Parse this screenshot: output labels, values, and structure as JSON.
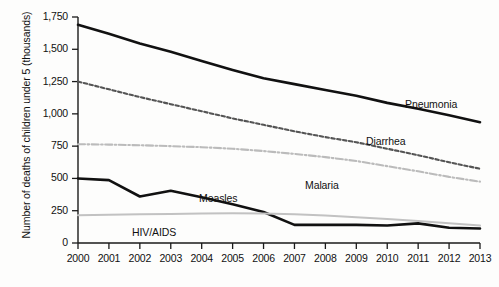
{
  "chart_data": {
    "type": "line",
    "title": "",
    "xlabel": "",
    "ylabel": "Number of deaths of children under 5 (thousands)",
    "x": [
      2000,
      2001,
      2002,
      2003,
      2004,
      2005,
      2006,
      2007,
      2008,
      2009,
      2010,
      2011,
      2012,
      2013
    ],
    "xticklabels": [
      "2000",
      "2001",
      "2002",
      "2003",
      "2004",
      "2005",
      "2006",
      "2007",
      "2008",
      "2009",
      "2010",
      "2011",
      "2012",
      "2013"
    ],
    "yticks": [
      0,
      250,
      500,
      750,
      1000,
      1250,
      1500,
      1750
    ],
    "yticklabels": [
      "0",
      "250",
      "500",
      "750",
      "1,000",
      "1,250",
      "1,500",
      "1,750"
    ],
    "ylim": [
      0,
      1750
    ],
    "xlim": [
      2000,
      2013
    ],
    "grid": false,
    "legend_position": "inline-annotations",
    "series": [
      {
        "name": "Pneumonia",
        "style": "solid",
        "color": "#111111",
        "width": 2.6,
        "label_x": 405,
        "label_y": 98,
        "values": [
          1690,
          1620,
          1545,
          1480,
          1410,
          1340,
          1275,
          1230,
          1185,
          1140,
          1085,
          1040,
          990,
          935
        ]
      },
      {
        "name": "Diarrhea",
        "style": "dashed",
        "color": "#555555",
        "width": 2.1,
        "label_x": 366,
        "label_y": 135,
        "values": [
          1250,
          1190,
          1130,
          1075,
          1020,
          965,
          915,
          865,
          820,
          780,
          730,
          680,
          625,
          575
        ]
      },
      {
        "name": "Malaria",
        "style": "dashdot",
        "color": "#bbbbbb",
        "width": 2.1,
        "label_x": 305,
        "label_y": 179,
        "values": [
          765,
          762,
          757,
          750,
          742,
          730,
          712,
          690,
          665,
          635,
          595,
          555,
          512,
          475
        ]
      },
      {
        "name": "Measles",
        "style": "solid",
        "color": "#111111",
        "width": 2.6,
        "label_x": 199,
        "label_y": 192,
        "values": [
          500,
          487,
          360,
          405,
          355,
          300,
          240,
          140,
          140,
          140,
          135,
          152,
          118,
          112
        ]
      },
      {
        "name": "HIV/AIDS",
        "style": "solid",
        "color": "#c2c2c2",
        "width": 2.0,
        "label_x": 132,
        "label_y": 226,
        "values": [
          215,
          218,
          222,
          225,
          228,
          230,
          228,
          222,
          212,
          200,
          186,
          170,
          152,
          135
        ]
      }
    ]
  },
  "axes": {
    "plot_left": 78,
    "plot_right": 480,
    "plot_top": 17,
    "plot_bottom": 243
  }
}
